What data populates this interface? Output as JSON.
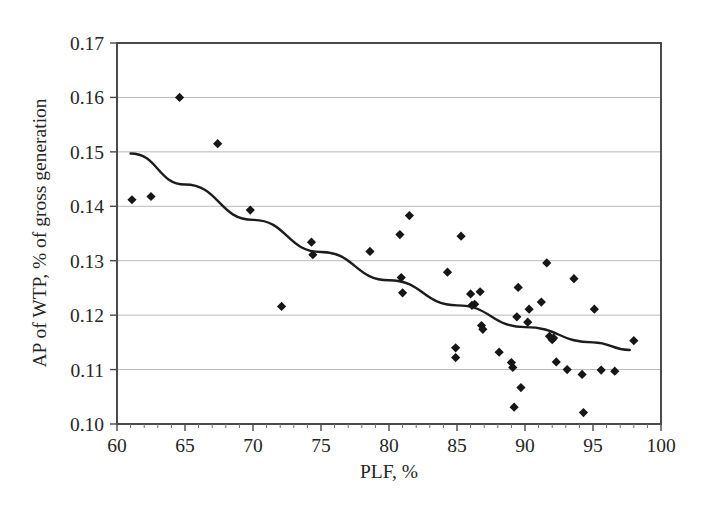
{
  "chart_data": {
    "type": "scatter",
    "title": "",
    "xlabel": "PLF, %",
    "ylabel": "AP of WTP, % of gross generation",
    "xlim": [
      60,
      100
    ],
    "ylim": [
      0.1,
      0.17
    ],
    "xticks": [
      60,
      65,
      70,
      75,
      80,
      85,
      90,
      95,
      100
    ],
    "xtick_labels": [
      "60",
      "65",
      "70",
      "75",
      "80",
      "85",
      "90",
      "95",
      "100"
    ],
    "yticks": [
      0.1,
      0.11,
      0.12,
      0.13,
      0.14,
      0.15,
      0.16,
      0.17
    ],
    "ytick_labels": [
      "0.10",
      "0.11",
      "0.12",
      "0.13",
      "0.14",
      "0.15",
      "0.16",
      "0.17"
    ],
    "grid": "horizontal",
    "legend": "none",
    "marker": "filled-diamond",
    "marker_color": "#161616",
    "series": [
      {
        "name": "Plants",
        "points": [
          [
            61.1,
            0.1412
          ],
          [
            62.5,
            0.1418
          ],
          [
            64.6,
            0.16
          ],
          [
            67.4,
            0.1515
          ],
          [
            69.8,
            0.1393
          ],
          [
            72.1,
            0.1216
          ],
          [
            74.3,
            0.1334
          ],
          [
            74.4,
            0.1311
          ],
          [
            78.6,
            0.1317
          ],
          [
            80.8,
            0.1348
          ],
          [
            80.9,
            0.1269
          ],
          [
            81.0,
            0.1241
          ],
          [
            81.5,
            0.1383
          ],
          [
            84.3,
            0.1279
          ],
          [
            84.9,
            0.114
          ],
          [
            84.9,
            0.1122
          ],
          [
            85.3,
            0.1345
          ],
          [
            86.0,
            0.1239
          ],
          [
            86.1,
            0.1218
          ],
          [
            86.3,
            0.122
          ],
          [
            86.7,
            0.1243
          ],
          [
            86.8,
            0.1181
          ],
          [
            86.9,
            0.1174
          ],
          [
            88.1,
            0.1132
          ],
          [
            89.0,
            0.1113
          ],
          [
            89.1,
            0.1104
          ],
          [
            89.2,
            0.1031
          ],
          [
            89.4,
            0.1197
          ],
          [
            89.5,
            0.1251
          ],
          [
            89.7,
            0.1067
          ],
          [
            90.2,
            0.1187
          ],
          [
            90.3,
            0.1211
          ],
          [
            91.2,
            0.1224
          ],
          [
            91.6,
            0.1296
          ],
          [
            91.8,
            0.1161
          ],
          [
            92.0,
            0.1155
          ],
          [
            92.1,
            0.1158
          ],
          [
            92.3,
            0.1114
          ],
          [
            93.1,
            0.11
          ],
          [
            93.6,
            0.1267
          ],
          [
            94.2,
            0.1091
          ],
          [
            94.3,
            0.1021
          ],
          [
            95.1,
            0.1211
          ],
          [
            95.6,
            0.1099
          ],
          [
            96.6,
            0.1097
          ],
          [
            98.0,
            0.1153
          ]
        ]
      }
    ],
    "trendline": {
      "style": "solid",
      "color": "#1c1c1c",
      "shape": "convex-decreasing",
      "points": [
        [
          61.0,
          0.1497
        ],
        [
          65.0,
          0.144
        ],
        [
          70.0,
          0.1375
        ],
        [
          75.0,
          0.1316
        ],
        [
          80.0,
          0.1264
        ],
        [
          85.0,
          0.1218
        ],
        [
          90.0,
          0.1178
        ],
        [
          95.0,
          0.115
        ],
        [
          97.7,
          0.1136
        ]
      ]
    }
  },
  "axes": {
    "x_title": "PLF, %",
    "y_title": "AP of WTP, % of gross generation"
  }
}
